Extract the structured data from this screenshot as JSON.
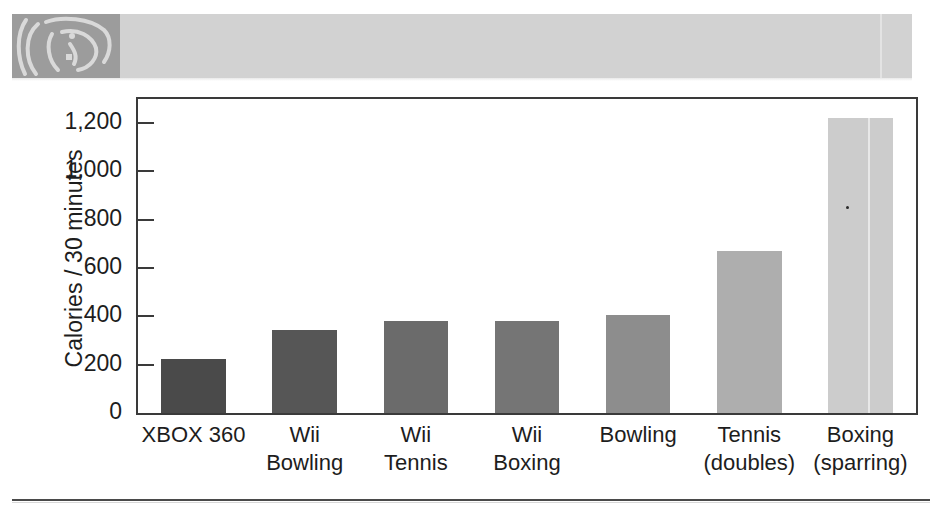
{
  "header_band": {
    "name": "decorative-scan-band",
    "band_color": "#d2d2d2",
    "figure_color": "#9c9c9c",
    "figure_line_color": "#d9d9d9"
  },
  "chart_data": {
    "type": "bar",
    "title": "",
    "xlabel": "",
    "ylabel": "Calories / 30 minutes",
    "ylim": [
      0,
      1300
    ],
    "ytick_values": [
      0,
      200,
      400,
      600,
      800,
      1000,
      1200
    ],
    "ytick_labels": [
      "0",
      "200",
      "400",
      "600",
      "800",
      "1,000",
      "1,200"
    ],
    "grid": false,
    "legend": false,
    "categories": [
      "XBOX 360",
      "Wii Bowling",
      "Wii Tennis",
      "Wii Boxing",
      "Bowling",
      "Tennis (doubles)",
      "Boxing (sparring)"
    ],
    "category_label_lines": [
      [
        "XBOX 360",
        ""
      ],
      [
        "Wii",
        "Bowling"
      ],
      [
        "Wii",
        "Tennis"
      ],
      [
        "Wii",
        "Boxing"
      ],
      [
        "Bowling",
        ""
      ],
      [
        "Tennis",
        "(doubles)"
      ],
      [
        "Boxing",
        "(sparring)"
      ]
    ],
    "values": [
      225,
      345,
      380,
      380,
      405,
      670,
      1220
    ],
    "bar_colors": [
      "#4a4a4a",
      "#565656",
      "#6b6b6b",
      "#757575",
      "#8d8d8d",
      "#aeaeae",
      "#cccccc"
    ]
  },
  "axis": {
    "frame_color": "#3a3a3a",
    "tick_color": "#3a3a3a",
    "text_color": "#1d1d1d"
  },
  "footer": {
    "rule_color": "#4a4a4a"
  }
}
